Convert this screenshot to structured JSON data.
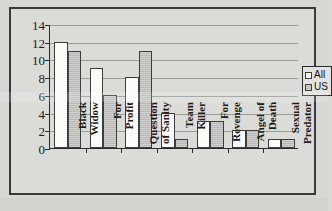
{
  "chart_data": {
    "type": "bar",
    "title": "",
    "subtitle": "",
    "xlabel": "",
    "ylabel": "",
    "grid": true,
    "legend_position": "right",
    "ylim": [
      0,
      14
    ],
    "ytick_labels": [
      "0",
      "2",
      "4",
      "6",
      "8",
      "10",
      "12",
      "14"
    ],
    "ytick_values": [
      0,
      2,
      4,
      6,
      8,
      10,
      12,
      14
    ],
    "categories": [
      "Black\nWidow",
      "For\nProfit",
      "Question\nof Sanity",
      "Team\nKiller",
      "For\nRevenge",
      "Angel of\nDeath",
      "Sexual\nPredator"
    ],
    "series": [
      {
        "name": "All",
        "values": [
          12,
          9,
          8,
          4,
          3,
          2,
          1
        ]
      },
      {
        "name": "US",
        "values": [
          11,
          6,
          11,
          1,
          3,
          2,
          1
        ]
      }
    ]
  },
  "legend": {
    "entries": [
      {
        "label": "All",
        "swatch": "white"
      },
      {
        "label": "US",
        "swatch": "gray"
      }
    ]
  },
  "colors": {
    "series_all_fill": "#fbfbfa",
    "series_us_fill": "#b8b8b4",
    "bar_outline": "#3d3d3d",
    "axis": "#2b2b2b",
    "gridline": "#9a9a97",
    "background": "#dbdbd8",
    "frame": "#3a3a3a",
    "text": "#1c1c1c"
  }
}
